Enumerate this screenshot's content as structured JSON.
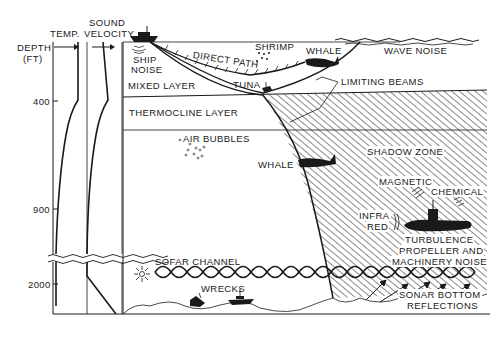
{
  "diagram": {
    "axis": {
      "depth_label_line1": "DEPTH",
      "depth_label_line2": "(FT)",
      "ticks": [
        "400",
        "900",
        "2000"
      ],
      "column_temp": "TEMP.",
      "column_sound_line1": "SOUND",
      "column_sound_line2": "VELOCITY"
    },
    "layers": {
      "mixed": "MIXED LAYER",
      "thermocline": "THERMOCLINE LAYER",
      "sofar": "SOFAR CHANNEL",
      "shadow": "SHADOW ZONE"
    },
    "labels": {
      "ship_noise_line1": "SHIP",
      "ship_noise_line2": "NOISE",
      "direct_path": "DIRECT PATH",
      "shrimp": "SHRIMP",
      "whale_top": "WHALE",
      "wave_noise": "WAVE NOISE",
      "tuna": "TUNA",
      "limiting_beams": "LIMITING BEAMS",
      "air_bubbles": "AIR BUBBLES",
      "whale_mid": "WHALE",
      "magnetic": "MAGNETIC",
      "chemical": "CHEMICAL",
      "infra_line1": "INFRA",
      "infra_line2": "RED",
      "turbulence": "TURBULENCE",
      "propeller_line1": "PROPELLER AND",
      "propeller_line2": "MACHINERY NOISE",
      "sonar_line1": "SONAR BOTTOM",
      "sonar_line2": "REFLECTIONS",
      "wrecks": "WRECKS"
    },
    "colors": {
      "ink": "#1a1a1a",
      "background": "#ffffff"
    }
  }
}
